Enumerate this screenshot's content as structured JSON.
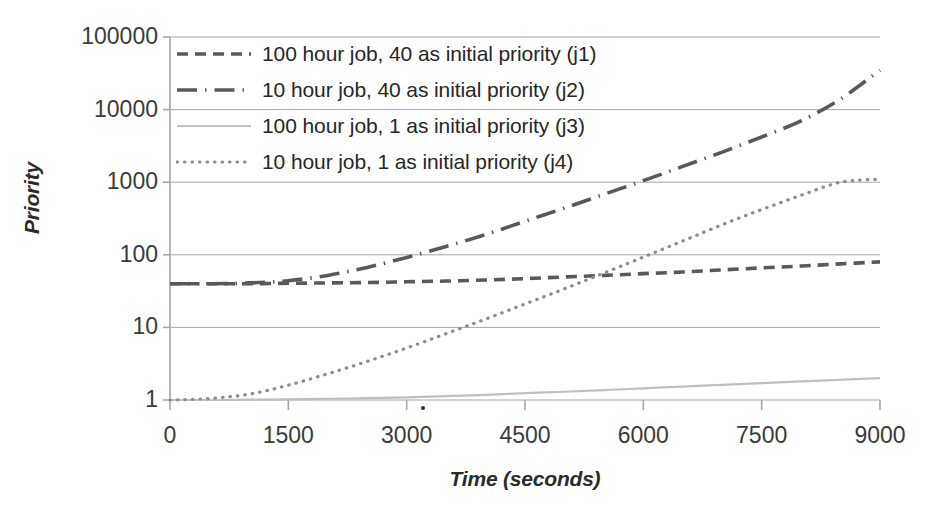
{
  "chart_data": {
    "type": "line",
    "title": "",
    "xlabel": "Time (seconds)",
    "ylabel": "Priority",
    "xlim": [
      0,
      9000
    ],
    "ylim": [
      1,
      100000
    ],
    "yscale": "log",
    "grid": true,
    "legend_position": "top-left",
    "x_ticks": [
      "0",
      "1500",
      "3000",
      "4500",
      "6000",
      "7500",
      "9000"
    ],
    "x_tick_values": [
      0,
      1500,
      3000,
      4500,
      6000,
      7500,
      9000
    ],
    "y_ticks": [
      "1",
      "10",
      "100",
      "1000",
      "10000",
      "100000"
    ],
    "y_tick_values": [
      1,
      10,
      100,
      1000,
      10000,
      100000
    ],
    "x": [
      0,
      500,
      1000,
      1500,
      2000,
      2500,
      3000,
      3500,
      4000,
      4500,
      5000,
      5500,
      6000,
      6500,
      7000,
      7500,
      8000,
      8500,
      9000
    ],
    "series": [
      {
        "name": "100 hour job, 40 as initial priority (j1)",
        "key": "j1",
        "style": "dashed",
        "color": "#595959",
        "values": [
          40,
          40,
          40,
          40.5,
          41,
          41.5,
          42.5,
          43.5,
          45,
          47,
          49.5,
          52,
          55,
          58,
          62,
          66,
          70,
          75,
          80
        ]
      },
      {
        "name": "10 hour job, 40 as initial priority (j2)",
        "key": "j2",
        "style": "dash-dot",
        "color": "#595959",
        "values": [
          40,
          40,
          41,
          44,
          52,
          67,
          92,
          130,
          190,
          290,
          440,
          680,
          1050,
          1650,
          2600,
          4200,
          7000,
          14000,
          35000
        ]
      },
      {
        "name": "100 hour job, 1 as initial priority (j3)",
        "key": "j3",
        "style": "solid",
        "color": "#bfbfbf",
        "values": [
          1,
          1.0,
          1.01,
          1.02,
          1.04,
          1.06,
          1.09,
          1.13,
          1.18,
          1.24,
          1.3,
          1.37,
          1.45,
          1.53,
          1.62,
          1.71,
          1.8,
          1.9,
          2.0
        ]
      },
      {
        "name": "10 hour job, 1 as initial priority (j4)",
        "key": "j4",
        "style": "dotted",
        "color": "#8c8c8c",
        "values": [
          1,
          1.05,
          1.2,
          1.6,
          2.3,
          3.4,
          5.2,
          8.2,
          13,
          21,
          34,
          56,
          93,
          155,
          260,
          420,
          660,
          1000,
          1100
        ]
      }
    ]
  },
  "axes": {
    "y_title": "Priority",
    "x_title": "Time (seconds)"
  },
  "legend": {
    "items": [
      {
        "label": "100 hour job, 40 as initial priority (j1)"
      },
      {
        "label": "10 hour job, 40 as initial priority (j2)"
      },
      {
        "label": "100 hour job, 1 as initial priority (j3)"
      },
      {
        "label": "10 hour job, 1 as initial priority (j4)"
      }
    ]
  },
  "colors": {
    "dark_line": "#595959",
    "mid_line": "#8c8c8c",
    "light_line": "#bfbfbf",
    "grid": "#a6a6a6",
    "text": "#2b2b2b",
    "background": "#ffffff"
  }
}
